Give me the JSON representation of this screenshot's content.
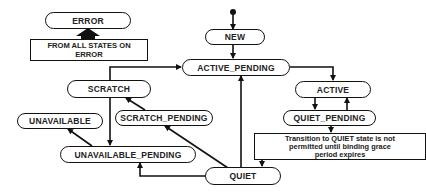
{
  "diagram": {
    "type": "state-machine",
    "states": {
      "error": "ERROR",
      "new": "NEW",
      "active_pending": "ACTIVE_PENDING",
      "scratch": "SCRATCH",
      "active": "ACTIVE",
      "scratch_pending": "SCRATCH_PENDING",
      "unavailable": "UNAVAILABLE",
      "quiet_pending": "QUIET_PENDING",
      "unavailable_pending": "UNAVAILABLE_PENDING",
      "quiet": "QUIET"
    },
    "notes": {
      "error_note_line1": "FROM ALL STATES ON",
      "error_note_line2": "ERROR",
      "quiet_note_line1": "Transition to QUIET state is not",
      "quiet_note_line2": "permitted until binding grace",
      "quiet_note_line3": "period expires"
    },
    "transitions": [
      {
        "from": "START",
        "to": "NEW"
      },
      {
        "from": "NEW",
        "to": "ACTIVE_PENDING"
      },
      {
        "from": "ACTIVE_PENDING",
        "to": "ACTIVE"
      },
      {
        "from": "SCRATCH",
        "to": "ACTIVE_PENDING"
      },
      {
        "from": "ACTIVE",
        "to": "QUIET_PENDING"
      },
      {
        "from": "QUIET_PENDING",
        "to": "ACTIVE"
      },
      {
        "from": "QUIET_PENDING",
        "to": "QUIET"
      },
      {
        "from": "QUIET",
        "to": "ACTIVE_PENDING"
      },
      {
        "from": "QUIET",
        "to": "SCRATCH_PENDING"
      },
      {
        "from": "QUIET",
        "to": "UNAVAILABLE_PENDING"
      },
      {
        "from": "SCRATCH_PENDING",
        "to": "SCRATCH"
      },
      {
        "from": "SCRATCH",
        "to": "UNAVAILABLE_PENDING"
      },
      {
        "from": "UNAVAILABLE_PENDING",
        "to": "UNAVAILABLE"
      },
      {
        "from": "ALL STATES",
        "to": "ERROR"
      }
    ]
  }
}
